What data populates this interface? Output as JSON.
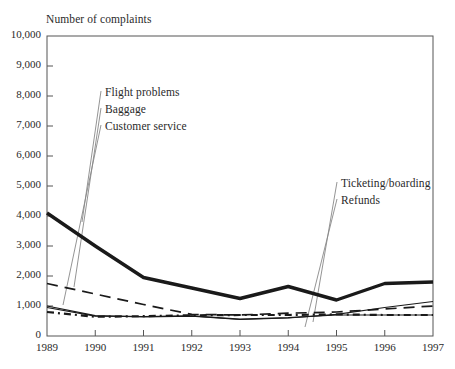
{
  "chart_data": {
    "type": "line",
    "title": "Number of complaints",
    "xlabel": "",
    "ylabel": "Number of complaints",
    "x": [
      1989,
      1990,
      1991,
      1992,
      1993,
      1994,
      1995,
      1996,
      1997
    ],
    "xtick_labels": [
      "1989",
      "1990",
      "1991",
      "1992",
      "1993",
      "1994",
      "1995",
      "1996",
      "1997"
    ],
    "ytick_labels": [
      "0",
      "1,000",
      "2,000",
      "3,000",
      "4,000",
      "5,000",
      "6,000",
      "7,000",
      "8,000",
      "9,000",
      "10,000"
    ],
    "ytick_values": [
      0,
      1000,
      2000,
      3000,
      4000,
      5000,
      6000,
      7000,
      8000,
      9000,
      10000
    ],
    "ylim": [
      0,
      10000
    ],
    "xlim": [
      1989,
      1997
    ],
    "grid": false,
    "legend_position": "annotations-with-leader-lines",
    "series": [
      {
        "name": "Flight problems",
        "style": "thick-solid",
        "values": [
          4100,
          3000,
          1950,
          1600,
          1250,
          1650,
          1200,
          1750,
          1800
        ]
      },
      {
        "name": "Baggage",
        "style": "long-dashed",
        "values": [
          1750,
          1400,
          1050,
          720,
          700,
          760,
          800,
          900,
          1000
        ]
      },
      {
        "name": "Customer service",
        "style": "thin-solid",
        "values": [
          1000,
          680,
          640,
          660,
          550,
          600,
          720,
          950,
          1150
        ]
      },
      {
        "name": "Ticketing/boarding",
        "style": "dotted",
        "values": [
          800,
          640,
          660,
          690,
          700,
          700,
          720,
          700,
          700
        ]
      },
      {
        "name": "Refunds",
        "style": "thin-solid-lower",
        "values": [
          950,
          660,
          650,
          670,
          560,
          610,
          700,
          700,
          700
        ]
      }
    ],
    "annotations": [
      {
        "text": "Flight problems",
        "x": 105,
        "y": 94
      },
      {
        "text": "Baggage",
        "x": 105,
        "y": 111
      },
      {
        "text": "Customer service",
        "x": 105,
        "y": 128
      },
      {
        "text": "Ticketing/boarding",
        "x": 341,
        "y": 185
      },
      {
        "text": "Refunds",
        "x": 341,
        "y": 202
      }
    ]
  },
  "colors": {
    "ink": "#1a1a1a",
    "axis": "#555555",
    "leader": "#888888",
    "background": "#ffffff"
  }
}
